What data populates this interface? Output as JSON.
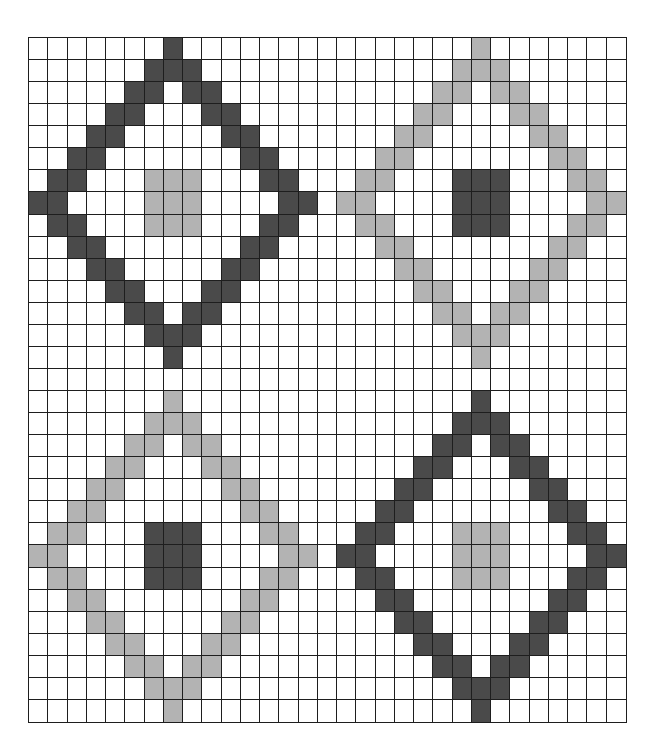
{
  "grid": {
    "columns": 31,
    "rows": 31,
    "colors": {
      "empty": "#ffffff",
      "dark": "#4a4a4a",
      "light": "#b3b3b3",
      "line": "#1e1e1e"
    }
  },
  "diamonds": [
    {
      "name": "top-left",
      "center_col": 7,
      "center_row": 7,
      "ring_color": "dark",
      "core_color": "light",
      "ring_inner_radius": 6,
      "ring_outer_radius": 7,
      "core_half_size": 1
    },
    {
      "name": "top-right",
      "center_col": 23,
      "center_row": 7,
      "ring_color": "light",
      "core_color": "dark",
      "ring_inner_radius": 6,
      "ring_outer_radius": 7,
      "core_half_size": 1
    },
    {
      "name": "bottom-left",
      "center_col": 7,
      "center_row": 23,
      "ring_color": "light",
      "core_color": "dark",
      "ring_inner_radius": 6,
      "ring_outer_radius": 7,
      "core_half_size": 1
    },
    {
      "name": "bottom-right",
      "center_col": 23,
      "center_row": 23,
      "ring_color": "dark",
      "core_color": "light",
      "ring_inner_radius": 6,
      "ring_outer_radius": 7,
      "core_half_size": 1
    }
  ]
}
